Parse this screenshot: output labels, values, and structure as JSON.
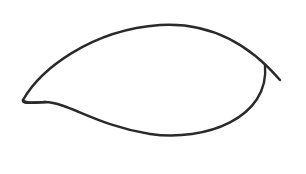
{
  "drawing": {
    "subject": "eye-outline-sketch",
    "background_color": "#ffffff",
    "stroke_color": "#2a2a2a",
    "stroke_width": 2.4,
    "paths": {
      "upper_lid": "M 23 100 C 40 70, 90 30, 160 25 C 210 22, 250 45, 280 80",
      "lower_lid": "M 23 100 C 22 104, 30 103, 45 102 C 70 103, 95 125, 150 134 C 205 142, 270 118, 265 65",
      "inner_corner_hook": "M 23 100 C 24 103, 32 103, 45 102"
    }
  }
}
